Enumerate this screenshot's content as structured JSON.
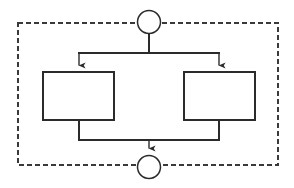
{
  "diagram": {
    "title": "",
    "type": "parallel-fork-join-flowchart",
    "canvas": {
      "width": 294,
      "height": 188,
      "background": "#ffffff"
    },
    "colors": {
      "stroke": "#2b2b2b",
      "dashed_border": "#3a3a3a",
      "node_fill": "#ffffff",
      "background": "#ffffff"
    },
    "boundary": {
      "name": "dashed-region",
      "style": "dashed",
      "x": 18,
      "y": 23,
      "width": 260,
      "height": 142,
      "dash": "5 3",
      "stroke_width": 1.6,
      "label": ""
    },
    "nodes": [
      {
        "id": "start",
        "shape": "circle",
        "name": "start-node",
        "cx": 149,
        "cy": 22,
        "r": 12,
        "label": ""
      },
      {
        "id": "task-left",
        "shape": "rectangle",
        "name": "left-activity-box",
        "x": 43,
        "y": 72,
        "width": 71,
        "height": 48,
        "label": ""
      },
      {
        "id": "task-right",
        "shape": "rectangle",
        "name": "right-activity-box",
        "x": 184,
        "y": 72,
        "width": 71,
        "height": 48,
        "label": ""
      },
      {
        "id": "end",
        "shape": "circle",
        "name": "end-node",
        "cx": 149,
        "cy": 167,
        "r": 12,
        "label": ""
      }
    ],
    "connectors": [
      {
        "id": "start-stem",
        "name": "start-to-fork-connector",
        "points": "149,34 149,53",
        "arrow": false
      },
      {
        "id": "fork-bar",
        "name": "fork-horizontal-bar",
        "points": "79,53 219,53",
        "arrow": false
      },
      {
        "id": "fork-to-left",
        "name": "fork-to-left-box-arrow",
        "points": "79,53 79,71",
        "arrow": true
      },
      {
        "id": "fork-to-right",
        "name": "fork-to-right-box-arrow",
        "points": "219,53 219,71",
        "arrow": true
      },
      {
        "id": "left-to-join",
        "name": "left-box-to-join-connector",
        "points": "79,120 79,140",
        "arrow": false
      },
      {
        "id": "right-to-join",
        "name": "right-box-to-join-connector",
        "points": "219,120 219,140",
        "arrow": false
      },
      {
        "id": "join-bar",
        "name": "join-horizontal-bar",
        "points": "79,140 219,140",
        "arrow": false
      },
      {
        "id": "join-to-end",
        "name": "join-to-end-arrow",
        "points": "149,140 149,154",
        "arrow": true
      }
    ]
  }
}
